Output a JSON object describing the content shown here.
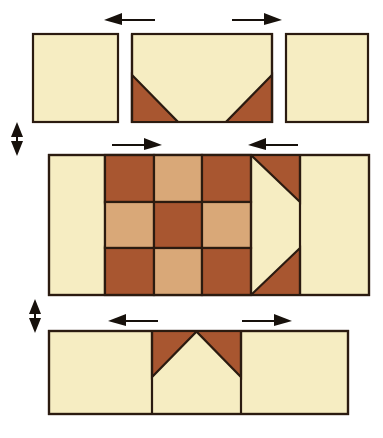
{
  "figure": {
    "type": "diagram",
    "background_color": "#ffffff"
  },
  "palette": {
    "light": "#f6edc2",
    "light_label": "cream background fabric",
    "medium": "#d9a878",
    "medium_label": "medium tan fabric",
    "dark": "#a85630",
    "dark_label": "dark rust brown fabric",
    "seam_line": "#2b1b10",
    "arrow": "#17110c"
  },
  "rows": [
    {
      "name": "top-row",
      "label": "Top row",
      "units": [
        {
          "name": "corner-square-top-left",
          "type": "plain-square",
          "fabric": "light"
        },
        {
          "name": "flying-geese-top",
          "type": "flying-geese",
          "sky": "dark",
          "goose": "light",
          "orientation": "point-up"
        },
        {
          "name": "corner-square-top-right",
          "type": "plain-square",
          "fabric": "light"
        }
      ],
      "press_arrows": [
        {
          "name": "press-arrow-top-left",
          "direction": "left",
          "icon": "arrow-left-icon"
        },
        {
          "name": "press-arrow-top-right",
          "direction": "right",
          "icon": "arrow-right-icon"
        }
      ]
    },
    {
      "name": "middle-row",
      "label": "Middle row",
      "units": [
        {
          "name": "flying-geese-left",
          "type": "flying-geese",
          "sky": "dark",
          "goose": "light",
          "orientation": "point-right"
        },
        {
          "name": "nine-patch-center",
          "type": "nine-patch",
          "grid": [
            [
              "dark",
              "medium",
              "dark"
            ],
            [
              "medium",
              "dark",
              "medium"
            ],
            [
              "dark",
              "medium",
              "dark"
            ]
          ]
        },
        {
          "name": "flying-geese-right",
          "type": "flying-geese",
          "sky": "dark",
          "goose": "light",
          "orientation": "point-left"
        }
      ],
      "press_arrows": [
        {
          "name": "press-arrow-middle-left",
          "direction": "right",
          "icon": "arrow-right-icon"
        },
        {
          "name": "press-arrow-middle-right",
          "direction": "left",
          "icon": "arrow-left-icon"
        }
      ]
    },
    {
      "name": "bottom-row",
      "label": "Bottom row",
      "units": [
        {
          "name": "corner-square-bottom-left",
          "type": "plain-square",
          "fabric": "light"
        },
        {
          "name": "flying-geese-bottom",
          "type": "flying-geese",
          "sky": "dark",
          "goose": "light",
          "orientation": "point-down"
        },
        {
          "name": "corner-square-bottom-right",
          "type": "plain-square",
          "fabric": "light"
        }
      ],
      "press_arrows": [
        {
          "name": "press-arrow-bottom-left",
          "direction": "left",
          "icon": "arrow-left-icon"
        },
        {
          "name": "press-arrow-bottom-right",
          "direction": "right",
          "icon": "arrow-right-icon"
        }
      ]
    }
  ],
  "join_arrows": [
    {
      "name": "join-arrow-upper",
      "direction": "vertical-both",
      "icon": "arrow-up-down-icon"
    },
    {
      "name": "join-arrow-lower",
      "direction": "vertical-both",
      "icon": "arrow-up-down-icon"
    }
  ]
}
